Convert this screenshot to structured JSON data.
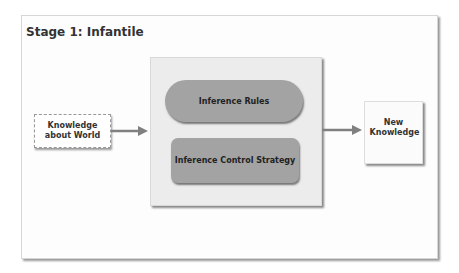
{
  "diagram": {
    "title": "Stage 1: Infantile",
    "nodes": {
      "input": {
        "label": "Knowledge about World"
      },
      "inference_rules": {
        "label": "Inference Rules"
      },
      "control_strategy": {
        "label": "Inference Control Strategy"
      },
      "output": {
        "label": "New Knowledge"
      }
    },
    "edges": [
      {
        "from": "Knowledge about World",
        "to": "Inference Engine"
      },
      {
        "from": "Inference Engine",
        "to": "New Knowledge"
      }
    ],
    "colors": {
      "node_fill": "#a3a3a3",
      "container_fill": "#ececec",
      "arrow": "#808080"
    }
  }
}
